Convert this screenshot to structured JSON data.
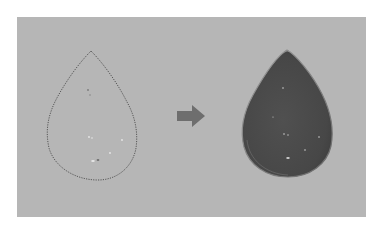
{
  "figure": {
    "background_color": "#b6b6b6",
    "page_color": "#ffffff",
    "left": {
      "label": "selection-outline",
      "stroke_color": "#555555",
      "style": "marching-ants dotted outline"
    },
    "arrow": {
      "direction": "right",
      "color": "#6e6e6e"
    },
    "right": {
      "label": "filled-teardrop",
      "fill_color": "#4a4a4a",
      "highlight_color": "#8a8a8a"
    }
  }
}
